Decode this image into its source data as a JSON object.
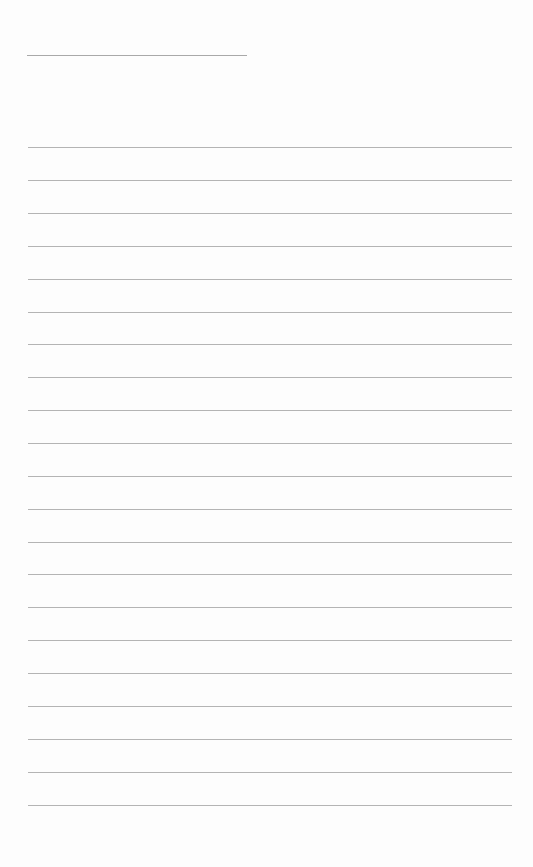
{
  "page": {
    "type": "ruled-sheet",
    "background": "#fdfdfd",
    "line_color": "#b4b4b4",
    "header_rule": {
      "x": 27,
      "y": 55,
      "width": 220
    },
    "ruled_lines": {
      "x": 28,
      "width": 484,
      "y_positions": [
        147,
        180,
        213,
        246,
        279,
        312,
        344,
        377,
        410,
        443,
        476,
        509,
        542,
        574,
        607,
        640,
        673,
        706,
        739,
        772,
        805
      ]
    }
  }
}
